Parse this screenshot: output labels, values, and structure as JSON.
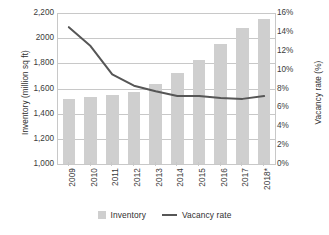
{
  "chart_data": {
    "type": "bar",
    "title": "",
    "subtitle": "",
    "xlabel": "",
    "ylabel": "Inventory (million sq ft)",
    "y2label": "Vacancy rate (%)",
    "categories": [
      "2009",
      "2010",
      "2011",
      "2012",
      "2013",
      "2014",
      "2015",
      "2016",
      "2017",
      "2018*"
    ],
    "series": [
      {
        "name": "Inventory",
        "type": "bar",
        "axis": "left",
        "color": "#cfcfcf",
        "values": [
          1520,
          1530,
          1550,
          1575,
          1635,
          1720,
          1825,
          1950,
          2080,
          2150
        ]
      },
      {
        "name": "Vacancy rate",
        "type": "line",
        "axis": "right",
        "color": "#565656",
        "values": [
          14.5,
          12.5,
          9.5,
          8.3,
          7.7,
          7.2,
          7.2,
          7.0,
          6.9,
          7.2
        ]
      }
    ],
    "ylim": [
      1000,
      2200
    ],
    "y2lim": [
      0,
      16
    ],
    "y_ticks": [
      1000,
      1200,
      1400,
      1600,
      1800,
      2000,
      2200
    ],
    "y_tick_labels": [
      "1,000",
      "1,200",
      "1,400",
      "1,600",
      "1,800",
      "2000",
      "2,200"
    ],
    "y2_ticks": [
      0,
      2,
      4,
      6,
      8,
      10,
      12,
      14,
      16
    ],
    "y2_tick_labels": [
      "0%",
      "2%",
      "4%",
      "6%",
      "8%",
      "10%",
      "12%",
      "14%",
      "16%"
    ],
    "grid": true,
    "grid_axis": "y-left",
    "legend_position": "bottom"
  },
  "legend": {
    "items": [
      {
        "label": "Inventory",
        "marker": "bar-swatch"
      },
      {
        "label": "Vacancy rate",
        "marker": "line-swatch"
      }
    ]
  },
  "colors": {
    "bar": "#cfcfcf",
    "line": "#565656",
    "grid": "#c8c8c8",
    "text": "#3a3a3a",
    "background": "#ffffff"
  }
}
